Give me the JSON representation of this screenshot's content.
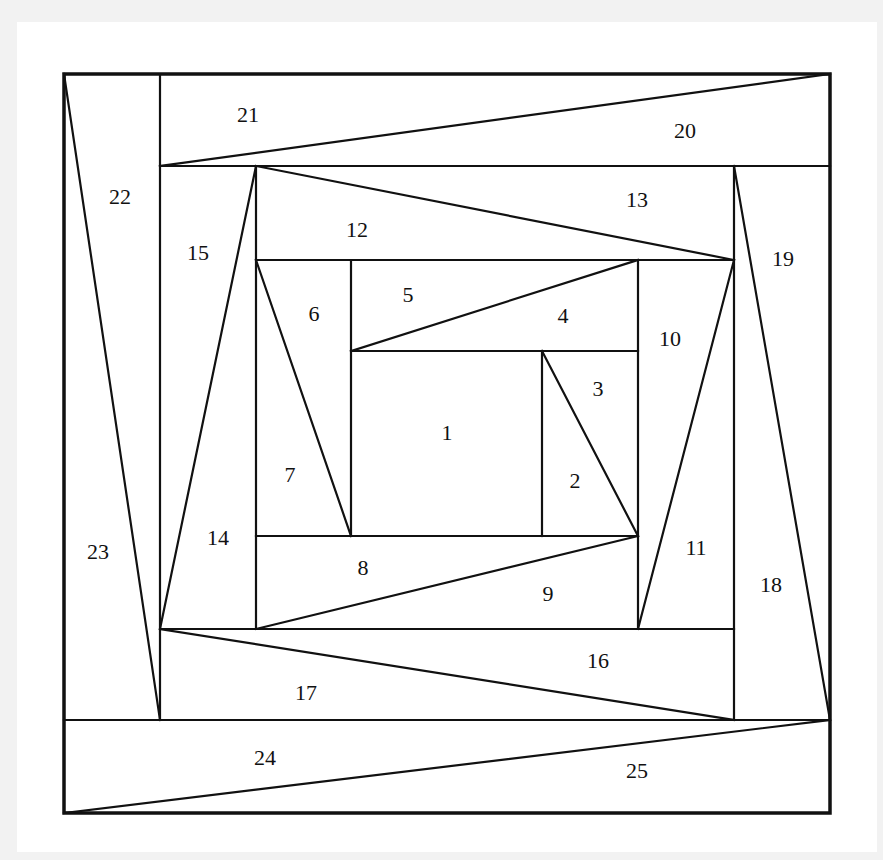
{
  "diagram": {
    "colors": {
      "background": "#f2f2f2",
      "panel": "#ffffff",
      "line": "#111111"
    },
    "outer_border": {
      "x1": 64,
      "y1": 74,
      "x2": 830,
      "y2": 813
    },
    "segments": [
      {
        "id": "h-166",
        "x1": 160,
        "y1": 166,
        "x2": 830,
        "y2": 166
      },
      {
        "id": "v-160",
        "x1": 160,
        "y1": 74,
        "x2": 160,
        "y2": 720
      },
      {
        "id": "h-720",
        "x1": 64,
        "y1": 720,
        "x2": 830,
        "y2": 720
      },
      {
        "id": "v-734",
        "x1": 734,
        "y1": 166,
        "x2": 734,
        "y2": 720
      },
      {
        "id": "h-629",
        "x1": 160,
        "y1": 629,
        "x2": 734,
        "y2": 629
      },
      {
        "id": "v-256",
        "x1": 256,
        "y1": 166,
        "x2": 256,
        "y2": 629
      },
      {
        "id": "h-260",
        "x1": 256,
        "y1": 260,
        "x2": 734,
        "y2": 260
      },
      {
        "id": "v-638",
        "x1": 638,
        "y1": 260,
        "x2": 638,
        "y2": 629
      },
      {
        "id": "h-536",
        "x1": 256,
        "y1": 536,
        "x2": 638,
        "y2": 536
      },
      {
        "id": "v-351",
        "x1": 351,
        "y1": 260,
        "x2": 351,
        "y2": 536
      },
      {
        "id": "h-351",
        "x1": 351,
        "y1": 351,
        "x2": 638,
        "y2": 351
      },
      {
        "id": "v-542",
        "x1": 542,
        "y1": 351,
        "x2": 542,
        "y2": 536
      },
      {
        "id": "d-2-3",
        "x1": 542,
        "y1": 351,
        "x2": 638,
        "y2": 536
      },
      {
        "id": "d-4-5",
        "x1": 351,
        "y1": 351,
        "x2": 638,
        "y2": 260
      },
      {
        "id": "d-6-7",
        "x1": 256,
        "y1": 260,
        "x2": 351,
        "y2": 536
      },
      {
        "id": "d-8-9",
        "x1": 256,
        "y1": 629,
        "x2": 638,
        "y2": 536
      },
      {
        "id": "d-10-11",
        "x1": 734,
        "y1": 260,
        "x2": 638,
        "y2": 629
      },
      {
        "id": "d-12-13",
        "x1": 256,
        "y1": 166,
        "x2": 734,
        "y2": 260
      },
      {
        "id": "d-14-15",
        "x1": 256,
        "y1": 166,
        "x2": 160,
        "y2": 629
      },
      {
        "id": "d-16-17",
        "x1": 160,
        "y1": 629,
        "x2": 734,
        "y2": 720
      },
      {
        "id": "d-18-19",
        "x1": 734,
        "y1": 166,
        "x2": 830,
        "y2": 720
      },
      {
        "id": "d-20-21",
        "x1": 830,
        "y1": 74,
        "x2": 160,
        "y2": 166
      },
      {
        "id": "d-22-23",
        "x1": 64,
        "y1": 74,
        "x2": 160,
        "y2": 720
      },
      {
        "id": "d-24-25",
        "x1": 64,
        "y1": 813,
        "x2": 830,
        "y2": 720
      }
    ],
    "labels": [
      {
        "text": "1",
        "x": 447,
        "y": 432
      },
      {
        "text": "2",
        "x": 575,
        "y": 480
      },
      {
        "text": "3",
        "x": 598,
        "y": 388
      },
      {
        "text": "4",
        "x": 563,
        "y": 315
      },
      {
        "text": "5",
        "x": 408,
        "y": 294
      },
      {
        "text": "6",
        "x": 314,
        "y": 313
      },
      {
        "text": "7",
        "x": 290,
        "y": 474
      },
      {
        "text": "8",
        "x": 363,
        "y": 567
      },
      {
        "text": "9",
        "x": 548,
        "y": 593
      },
      {
        "text": "10",
        "x": 670,
        "y": 338
      },
      {
        "text": "11",
        "x": 696,
        "y": 547
      },
      {
        "text": "12",
        "x": 357,
        "y": 229
      },
      {
        "text": "13",
        "x": 637,
        "y": 199
      },
      {
        "text": "14",
        "x": 218,
        "y": 537
      },
      {
        "text": "15",
        "x": 198,
        "y": 252
      },
      {
        "text": "16",
        "x": 598,
        "y": 660
      },
      {
        "text": "17",
        "x": 306,
        "y": 692
      },
      {
        "text": "18",
        "x": 771,
        "y": 584
      },
      {
        "text": "19",
        "x": 783,
        "y": 258
      },
      {
        "text": "20",
        "x": 685,
        "y": 130
      },
      {
        "text": "21",
        "x": 248,
        "y": 114
      },
      {
        "text": "22",
        "x": 120,
        "y": 196
      },
      {
        "text": "23",
        "x": 98,
        "y": 551
      },
      {
        "text": "24",
        "x": 265,
        "y": 757
      },
      {
        "text": "25",
        "x": 637,
        "y": 770
      }
    ]
  }
}
